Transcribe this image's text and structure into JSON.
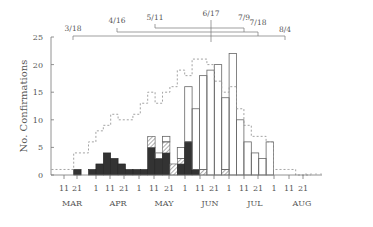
{
  "chart_data": {
    "type": "bar",
    "title": "",
    "ylabel": "No. Confirmations",
    "xlabel": "",
    "ylim": [
      0,
      25
    ],
    "yticks": [
      0,
      5,
      10,
      15,
      20,
      25
    ],
    "grid": false,
    "bin_days": 5,
    "x_tick_labels": [
      "11",
      "21",
      "1",
      "11",
      "21",
      "1",
      "11",
      "21",
      "1",
      "11",
      "21",
      "1",
      "11",
      "21",
      "1",
      "11",
      "21"
    ],
    "month_labels": [
      "MAR",
      "APR",
      "MAY",
      "JUN",
      "JUL",
      "AUG"
    ],
    "bins": [
      "3/6",
      "3/11",
      "3/16",
      "3/21",
      "3/26",
      "3/31",
      "4/5",
      "4/10",
      "4/15",
      "4/20",
      "4/25",
      "4/30",
      "5/5",
      "5/10",
      "5/15",
      "5/20",
      "5/25",
      "5/30",
      "6/4",
      "6/9",
      "6/14",
      "6/19",
      "6/24",
      "6/29",
      "7/4",
      "7/9",
      "7/14",
      "7/19",
      "7/24",
      "7/29",
      "8/3",
      "8/8",
      "8/13",
      "8/18",
      "8/23"
    ],
    "series": [
      {
        "name": "black (filled)",
        "style": "solid-black",
        "values": [
          0,
          0,
          0,
          1,
          0,
          1,
          2,
          4,
          3,
          2,
          1,
          1,
          1,
          5,
          3,
          4,
          0,
          2,
          6,
          1,
          0,
          0,
          0,
          0,
          0,
          0,
          0,
          0,
          0,
          0,
          0,
          0,
          0,
          0,
          0
        ]
      },
      {
        "name": "hatched",
        "style": "hatched",
        "values": [
          0,
          0,
          0,
          0,
          0,
          0,
          0,
          0,
          0,
          0,
          0,
          0,
          0,
          2,
          0,
          2,
          2,
          1,
          0,
          0,
          1,
          0,
          0,
          1,
          0,
          0,
          0,
          0,
          0,
          0,
          0,
          0,
          0,
          0,
          0
        ]
      },
      {
        "name": "open (white)",
        "style": "open",
        "values": [
          0,
          0,
          0,
          0,
          0,
          0,
          0,
          0,
          0,
          0,
          0,
          0,
          0,
          0,
          1,
          1,
          0,
          2,
          10,
          11,
          17,
          19,
          20,
          13,
          22,
          10,
          6,
          4,
          3,
          6,
          0,
          0,
          0,
          0,
          0
        ]
      },
      {
        "name": "dashed outline",
        "style": "dashed-step",
        "values": [
          1,
          1,
          1,
          4,
          4,
          6,
          8,
          9,
          11,
          10,
          10,
          11,
          13,
          15,
          13,
          15,
          16,
          19,
          18,
          21,
          21,
          20,
          17,
          15,
          16,
          12,
          9,
          7,
          7,
          6,
          1,
          1,
          1,
          0,
          0
        ]
      }
    ],
    "annotations": [
      {
        "label": "3/18",
        "level": 3
      },
      {
        "label": "4/16",
        "level": 2
      },
      {
        "label": "5/11",
        "level": 1
      },
      {
        "label": "6/17",
        "level": 0
      },
      {
        "label": "7/9",
        "level": 1
      },
      {
        "label": "7/18",
        "level": 2
      },
      {
        "label": "8/4",
        "level": 3
      }
    ]
  }
}
